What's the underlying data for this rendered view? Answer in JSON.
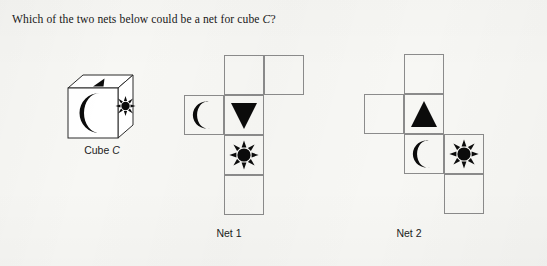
{
  "question": {
    "text_before": "Which of the two nets below could be a net for cube ",
    "italic_symbol": "C",
    "text_after": "?",
    "full_text": "Which of the two nets below could be a net for cube C?"
  },
  "colors": {
    "background": "#f7f7f4",
    "ink": "#0b0b0b",
    "cell_border": "#8b8b8b",
    "cube_outline": "#2a2a2a"
  },
  "cube": {
    "label_text": "Cube ",
    "label_italic": "C",
    "faces": {
      "front": "crescent-moon",
      "top": "triangle",
      "right": "sun"
    }
  },
  "nets": [
    {
      "id": "net-1",
      "label": "Net 1",
      "cells": [
        {
          "name": "net1-cell-top-middle",
          "x": 224,
          "y": 55,
          "icon": "none"
        },
        {
          "name": "net1-cell-top-right",
          "x": 264,
          "y": 55,
          "icon": "none"
        },
        {
          "name": "net1-cell-moon",
          "x": 184,
          "y": 95,
          "icon": "crescent-moon"
        },
        {
          "name": "net1-cell-triangle",
          "x": 224,
          "y": 95,
          "icon": "triangle-down"
        },
        {
          "name": "net1-cell-sun",
          "x": 224,
          "y": 135,
          "icon": "sun"
        },
        {
          "name": "net1-cell-bottom",
          "x": 224,
          "y": 175,
          "icon": "none"
        }
      ],
      "label_x": 184,
      "label_y": 227
    },
    {
      "id": "net-2",
      "label": "Net 2",
      "cells": [
        {
          "name": "net2-cell-top",
          "x": 404,
          "y": 54,
          "icon": "none"
        },
        {
          "name": "net2-cell-left",
          "x": 364,
          "y": 94,
          "icon": "none"
        },
        {
          "name": "net2-cell-triangle",
          "x": 404,
          "y": 94,
          "icon": "triangle-up"
        },
        {
          "name": "net2-cell-moon",
          "x": 404,
          "y": 134,
          "icon": "crescent-moon"
        },
        {
          "name": "net2-cell-sun",
          "x": 444,
          "y": 134,
          "icon": "sun"
        },
        {
          "name": "net2-cell-bottom",
          "x": 444,
          "y": 174,
          "icon": "none"
        }
      ],
      "label_x": 364,
      "label_y": 227
    }
  ],
  "icon_names": {
    "moon": "crescent-moon-icon",
    "sun": "sun-icon",
    "triangle_up": "triangle-up-icon",
    "triangle_down": "triangle-down-icon"
  }
}
